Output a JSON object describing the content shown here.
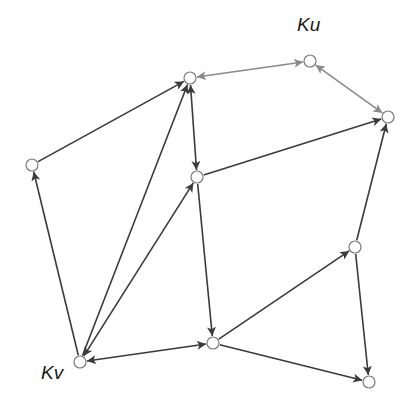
{
  "labels": {
    "ku": "Ku",
    "kv": "Kv"
  },
  "colors": {
    "edge_dark": "#3a3a3a",
    "edge_gray": "#8a8a8a",
    "node_fill": "#ffffff",
    "node_stroke": "#7a7a7a",
    "label": "#1a1a1a"
  },
  "nodes": [
    {
      "id": "A",
      "x": 32,
      "y": 165
    },
    {
      "id": "B",
      "x": 190,
      "y": 78
    },
    {
      "id": "Ku",
      "x": 310,
      "y": 61,
      "label": "Ku"
    },
    {
      "id": "C",
      "x": 388,
      "y": 117
    },
    {
      "id": "D",
      "x": 197,
      "y": 177
    },
    {
      "id": "E",
      "x": 355,
      "y": 247
    },
    {
      "id": "Kv",
      "x": 80,
      "y": 362,
      "label": "Kv"
    },
    {
      "id": "F",
      "x": 213,
      "y": 343
    },
    {
      "id": "G",
      "x": 369,
      "y": 382
    }
  ],
  "edges": [
    {
      "from": "A",
      "to": "B",
      "directed": "forward",
      "style": "dark"
    },
    {
      "from": "Kv",
      "to": "A",
      "directed": "forward",
      "style": "dark"
    },
    {
      "from": "Kv",
      "to": "B",
      "directed": "forward",
      "style": "dark"
    },
    {
      "from": "B",
      "to": "D",
      "directed": "both",
      "style": "dark"
    },
    {
      "from": "B",
      "to": "Ku",
      "directed": "both",
      "style": "gray"
    },
    {
      "from": "Ku",
      "to": "C",
      "directed": "both",
      "style": "gray"
    },
    {
      "from": "D",
      "to": "C",
      "directed": "forward",
      "style": "dark"
    },
    {
      "from": "E",
      "to": "C",
      "directed": "forward",
      "style": "dark"
    },
    {
      "from": "D",
      "to": "F",
      "directed": "forward",
      "style": "dark"
    },
    {
      "from": "Kv",
      "to": "D",
      "directed": "both",
      "style": "dark"
    },
    {
      "from": "Kv",
      "to": "F",
      "directed": "both",
      "style": "dark"
    },
    {
      "from": "F",
      "to": "E",
      "directed": "forward",
      "style": "dark"
    },
    {
      "from": "F",
      "to": "G",
      "directed": "forward",
      "style": "dark"
    },
    {
      "from": "E",
      "to": "G",
      "directed": "forward",
      "style": "dark"
    }
  ]
}
